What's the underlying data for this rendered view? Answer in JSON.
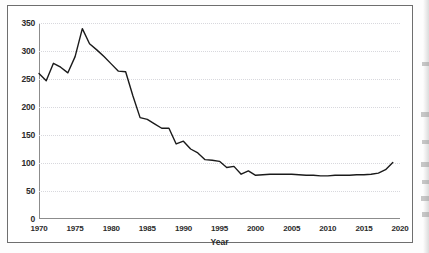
{
  "figure": {
    "frame_color": "#6e6e6e",
    "background": "#ffffff"
  },
  "chart_data": {
    "type": "line",
    "title": "",
    "subtitle": "",
    "xlabel": "Year",
    "ylabel": "",
    "grid": true,
    "legend": false,
    "legend_position": "none",
    "line_color": "#1a1a1a",
    "xlim": [
      1970,
      2020
    ],
    "ylim": [
      0,
      350
    ],
    "xticks": [
      1970,
      1975,
      1980,
      1985,
      1990,
      1995,
      2000,
      2005,
      2010,
      2015,
      2020
    ],
    "xtick_labels": [
      "1970",
      "1975",
      "1980",
      "1985",
      "1990",
      "1995",
      "2000",
      "2005",
      "2010",
      "2015",
      "2020"
    ],
    "yticks": [
      0,
      50,
      100,
      150,
      200,
      250,
      300,
      350
    ],
    "ytick_labels": [
      "0",
      "50",
      "100",
      "150",
      "200",
      "250",
      "300",
      "350"
    ],
    "x": [
      1970,
      1971,
      1972,
      1973,
      1974,
      1975,
      1976,
      1977,
      1978,
      1979,
      1980,
      1981,
      1982,
      1983,
      1984,
      1985,
      1986,
      1987,
      1988,
      1989,
      1990,
      1991,
      1992,
      1993,
      1994,
      1995,
      1996,
      1997,
      1998,
      1999,
      2000,
      2001,
      2002,
      2003,
      2004,
      2005,
      2006,
      2007,
      2008,
      2009,
      2010,
      2011,
      2012,
      2013,
      2014,
      2015,
      2016,
      2017,
      2018,
      2019
    ],
    "values": [
      260,
      247,
      278,
      271,
      261,
      290,
      340,
      313,
      302,
      290,
      277,
      264,
      263,
      220,
      181,
      178,
      170,
      162,
      162,
      134,
      139,
      125,
      118,
      106,
      105,
      103,
      92,
      94,
      80,
      86,
      78,
      79,
      80,
      80,
      80,
      80,
      79,
      78,
      78,
      77,
      77,
      78,
      78,
      78,
      79,
      79,
      80,
      82,
      88,
      101
    ],
    "series": [
      {
        "name": "series-1",
        "values": [
          260,
          247,
          278,
          271,
          261,
          290,
          340,
          313,
          302,
          290,
          277,
          264,
          263,
          220,
          181,
          178,
          170,
          162,
          162,
          134,
          139,
          125,
          118,
          106,
          105,
          103,
          92,
          94,
          80,
          86,
          78,
          79,
          80,
          80,
          80,
          80,
          79,
          78,
          78,
          77,
          77,
          78,
          78,
          78,
          79,
          79,
          80,
          82,
          88,
          101
        ]
      }
    ],
    "annotations": []
  }
}
